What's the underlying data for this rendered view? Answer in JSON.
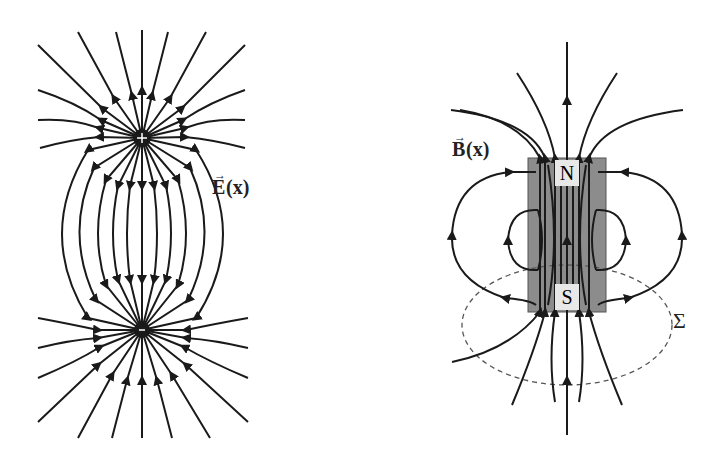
{
  "figure": {
    "left_panel": {
      "title": "Electric dipole field lines",
      "field_label": "E",
      "field_arg": "(x)",
      "field_label_full": "E(x)",
      "charges": [
        {
          "sign": "+",
          "x": 142,
          "y": 138
        },
        {
          "sign": "-",
          "x": 142,
          "y": 330
        }
      ]
    },
    "right_panel": {
      "title": "Bar magnet field lines",
      "field_label": "B",
      "field_arg": "(x)",
      "field_label_full": "B(x)",
      "north_label": "N",
      "south_label": "S",
      "surface_label": "Σ",
      "magnet_color": "#8c8c8c"
    },
    "colors": {
      "line": "#1a1a1a",
      "background": "#ffffff",
      "dashed": "#555555"
    }
  }
}
